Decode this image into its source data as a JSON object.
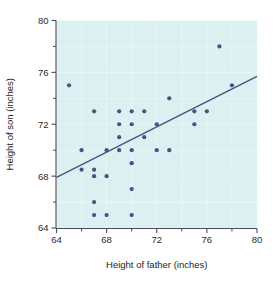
{
  "chart_data": {
    "type": "scatter",
    "title": "",
    "xlabel": "Height of father (inches)",
    "ylabel": "Height of son (inches)",
    "xlim": [
      64,
      80
    ],
    "ylim": [
      64,
      80
    ],
    "xticks": [
      64,
      68,
      72,
      76,
      80
    ],
    "xticklabels": [
      "64",
      "68",
      "72",
      "76",
      "80"
    ],
    "xticks_minor": [
      66,
      70,
      74,
      78
    ],
    "yticks": [
      64,
      68,
      72,
      76,
      80
    ],
    "yticklabels": [
      "64",
      "68",
      "72",
      "76",
      "80"
    ],
    "yticks_minor": [
      66,
      70,
      74,
      78
    ],
    "grid": true,
    "legend": "none",
    "plot_background_color": "#dcf0f2",
    "point_color": "#4d5082",
    "line_color": "#4d5082",
    "point_radius": 2.1,
    "series": [
      {
        "name": "father-son heights",
        "marker": "circle",
        "points": [
          [
            65.0,
            75.0
          ],
          [
            66.0,
            70.0
          ],
          [
            66.0,
            68.5
          ],
          [
            67.0,
            73.0
          ],
          [
            67.0,
            68.5
          ],
          [
            67.0,
            68.0
          ],
          [
            67.0,
            66.0
          ],
          [
            67.0,
            65.0
          ],
          [
            68.0,
            70.0
          ],
          [
            68.0,
            68.0
          ],
          [
            68.0,
            65.0
          ],
          [
            69.0,
            73.0
          ],
          [
            69.0,
            72.0
          ],
          [
            69.0,
            70.0
          ],
          [
            69.0,
            71.0
          ],
          [
            70.0,
            73.0
          ],
          [
            70.0,
            72.0
          ],
          [
            70.0,
            70.0
          ],
          [
            70.0,
            69.0
          ],
          [
            70.0,
            67.0
          ],
          [
            70.0,
            65.0
          ],
          [
            71.0,
            73.0
          ],
          [
            71.0,
            71.0
          ],
          [
            72.0,
            72.0
          ],
          [
            72.0,
            70.0
          ],
          [
            73.0,
            74.0
          ],
          [
            73.0,
            70.0
          ],
          [
            75.0,
            73.0
          ],
          [
            75.0,
            72.0
          ],
          [
            76.0,
            73.0
          ],
          [
            77.0,
            78.0
          ],
          [
            78.0,
            75.0
          ]
        ]
      }
    ],
    "fit_line": {
      "name": "regression-line",
      "x_start": 64.0,
      "y_start": 67.9,
      "x_end": 80.0,
      "y_end": 75.7
    }
  }
}
